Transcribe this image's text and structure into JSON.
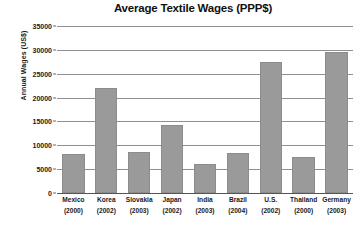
{
  "chart_data": {
    "type": "bar",
    "title": "Average Textile Wages (PPP$)",
    "xlabel": "",
    "ylabel": "Annual Wages (US$)",
    "ylim": [
      0,
      35000
    ],
    "yticks": [
      0,
      5000,
      10000,
      15000,
      20000,
      25000,
      30000,
      35000
    ],
    "ytick_labels": [
      "0",
      "5000",
      "10000",
      "15000",
      "20000",
      "25000",
      "30000",
      "35000"
    ],
    "grid": true,
    "legend": null,
    "bar_color": "#9a9a9a",
    "categories": [
      "Mexico",
      "Korea",
      "Slovakia",
      "Japan",
      "India",
      "Brazil",
      "U.S.",
      "Thailand",
      "Germany"
    ],
    "category_years": [
      "(2000)",
      "(2002)",
      "(2003)",
      "(2002)",
      "(2003)",
      "(2004)",
      "(2002)",
      "(2000)",
      "(2003)"
    ],
    "values": [
      8200,
      22000,
      8700,
      14300,
      6100,
      8400,
      27500,
      7500,
      29550
    ],
    "points": [
      {
        "label": "Mexico",
        "year": "(2000)",
        "value": 8200
      },
      {
        "label": "Korea",
        "year": "(2002)",
        "value": 22000
      },
      {
        "label": "Slovakia",
        "year": "(2003)",
        "value": 8700
      },
      {
        "label": "Japan",
        "year": "(2002)",
        "value": 14300
      },
      {
        "label": "India",
        "year": "(2003)",
        "value": 6100
      },
      {
        "label": "Brazil",
        "year": "(2004)",
        "value": 8400
      },
      {
        "label": "U.S.",
        "year": "(2002)",
        "value": 27500
      },
      {
        "label": "Thailand",
        "year": "(2000)",
        "value": 7500
      },
      {
        "label": "Germany",
        "year": "(2003)",
        "value": 29550
      }
    ]
  }
}
